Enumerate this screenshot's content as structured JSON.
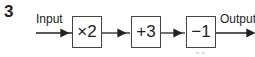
{
  "question_number": "3",
  "input_label": "Input",
  "output_label": "Output",
  "operations": [
    {
      "label": "×2"
    },
    {
      "label": "+3"
    },
    {
      "label": "−1"
    }
  ],
  "footer_fragment": "\" \""
}
